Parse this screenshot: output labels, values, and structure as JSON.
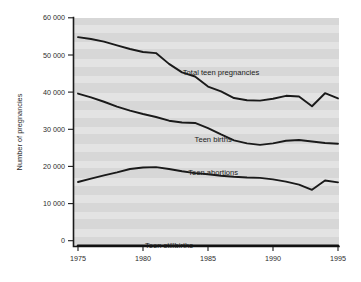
{
  "chart_data": {
    "type": "line",
    "title": "",
    "xlabel": "",
    "ylabel": "Number of pregnancies",
    "xlim": [
      1975,
      1995
    ],
    "ylim": [
      0,
      60000
    ],
    "grid": false,
    "legend_position": "inline-labels",
    "x": [
      1975,
      1976,
      1977,
      1978,
      1979,
      1980,
      1981,
      1982,
      1983,
      1984,
      1985,
      1986,
      1987,
      1988,
      1989,
      1990,
      1991,
      1992,
      1993,
      1994,
      1995
    ],
    "xtick_labels": [
      "1975",
      "1980",
      "1985",
      "1990",
      "1995"
    ],
    "xticks": [
      1975,
      1980,
      1985,
      1990,
      1995
    ],
    "ytick_labels": [
      "0",
      "10 000",
      "20 000",
      "30 000",
      "40 000",
      "50 000",
      "60 000"
    ],
    "yticks": [
      0,
      10000,
      20000,
      30000,
      40000,
      50000,
      60000
    ],
    "series": [
      {
        "name": "Total teen pregnancies",
        "label": "Total teen pregnancies",
        "color": "#1a1a1a",
        "label_x": 1986.0,
        "label_y": 44500,
        "values": [
          54800,
          54300,
          53600,
          52600,
          51600,
          50800,
          50500,
          47600,
          45300,
          44200,
          41500,
          40200,
          38400,
          37800,
          37700,
          38200,
          39000,
          38800,
          36200,
          39700,
          38300
        ]
      },
      {
        "name": "Teen births",
        "label": "Teen births",
        "color": "#1a1a1a",
        "label_x": 1985.4,
        "label_y": 26600,
        "values": [
          39600,
          38600,
          37400,
          36100,
          35000,
          34100,
          33300,
          32300,
          31800,
          31700,
          30300,
          28600,
          27000,
          26200,
          25800,
          26200,
          26900,
          27100,
          26700,
          26300,
          26100
        ]
      },
      {
        "name": "Teen abortions",
        "label": "Teen abortions",
        "color": "#1a1a1a",
        "label_x": 1985.4,
        "label_y": 17700,
        "values": [
          15800,
          16700,
          17600,
          18400,
          19300,
          19700,
          19800,
          19300,
          18700,
          18200,
          17900,
          17500,
          17200,
          17000,
          16900,
          16500,
          15900,
          15100,
          13700,
          16200,
          15700
        ]
      },
      {
        "name": "Teen stillbirths",
        "label": "Teen stillbirths",
        "color": "#111111",
        "label_x": 1982.0,
        "label_y": -1900,
        "values": [
          -1350,
          -1350,
          -1350,
          -1350,
          -1350,
          -1350,
          -1350,
          -1350,
          -1350,
          -1350,
          -1350,
          -1350,
          -1350,
          -1350,
          -1350,
          -1350,
          -1350,
          -1350,
          -1350,
          -1350,
          -1350
        ]
      }
    ]
  },
  "axis": {
    "y_title": "Number of pregnancies"
  }
}
